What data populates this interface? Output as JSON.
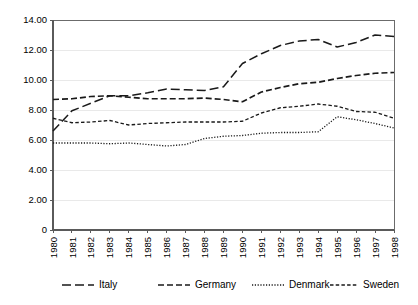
{
  "chart_data": {
    "type": "line",
    "title": "",
    "subtitle": "",
    "xlabel": "",
    "ylabel": "",
    "grid": true,
    "legend_position": "bottom",
    "xlim": [
      1980,
      1998
    ],
    "ylim": [
      0,
      14
    ],
    "ytick_values": [
      0,
      2,
      4,
      6,
      8,
      10,
      12,
      14
    ],
    "ytick_labels": [
      "0",
      "2.00",
      "4.00",
      "6.00",
      "8.00",
      "10.00",
      "12.00",
      "14.00"
    ],
    "categories": [
      "1980",
      "1981",
      "1982",
      "1983",
      "1984",
      "1985",
      "1986",
      "1987",
      "1988",
      "1989",
      "1990",
      "1991",
      "1992",
      "1993",
      "1994",
      "1995",
      "1996",
      "1997",
      "1998"
    ],
    "series": [
      {
        "name": "Italy",
        "dash": "9,4",
        "width": 1.5,
        "color": "#1a1a1a",
        "values": [
          6.6,
          7.95,
          8.45,
          8.95,
          8.95,
          9.15,
          9.4,
          9.35,
          9.3,
          9.55,
          11.1,
          11.75,
          12.3,
          12.6,
          12.7,
          12.2,
          12.5,
          13.0,
          12.9
        ]
      },
      {
        "name": "Germany",
        "dash": "6,3",
        "width": 1.7,
        "color": "#2b2b2b",
        "values": [
          8.7,
          8.75,
          8.9,
          8.95,
          8.85,
          8.75,
          8.75,
          8.75,
          8.8,
          8.7,
          8.55,
          9.2,
          9.5,
          9.75,
          9.85,
          10.1,
          10.3,
          10.45,
          10.5
        ]
      },
      {
        "name": "Denmark",
        "dash": "1.2,1.6",
        "width": 1.3,
        "color": "#1a1a1a",
        "values": [
          5.8,
          5.8,
          5.8,
          5.75,
          5.8,
          5.7,
          5.6,
          5.7,
          6.1,
          6.25,
          6.3,
          6.45,
          6.5,
          6.5,
          6.55,
          7.55,
          7.35,
          7.1,
          6.8
        ]
      },
      {
        "name": "Sweden",
        "dash": "3.5,2.2",
        "width": 1.3,
        "color": "#1a1a1a",
        "values": [
          7.45,
          7.15,
          7.2,
          7.3,
          7.0,
          7.1,
          7.15,
          7.2,
          7.2,
          7.2,
          7.25,
          7.8,
          8.15,
          8.25,
          8.4,
          8.25,
          7.9,
          7.85,
          7.45
        ]
      }
    ],
    "legend": [
      {
        "label": "Italy",
        "dash": "9,4",
        "width": 1.5
      },
      {
        "label": "Germany",
        "dash": "6,3",
        "width": 1.7
      },
      {
        "label": "Denmark",
        "dash": "1.2,1.6",
        "width": 1.3
      },
      {
        "label": "Sweden",
        "dash": "3.5,2.2",
        "width": 1.3
      }
    ],
    "colors": {
      "axis": "#5a5a5a",
      "frame": "#6b6b6b",
      "grid": "#e4e4e4",
      "line": "#1a1a1a",
      "text": "#000000",
      "background": "#ffffff"
    }
  }
}
